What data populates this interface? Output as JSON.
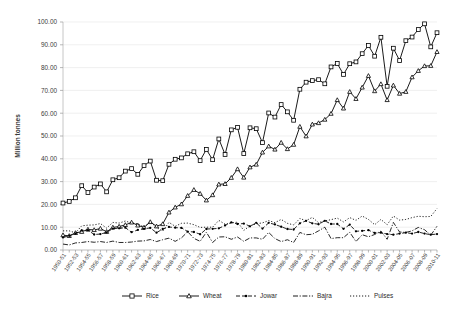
{
  "chart_data": {
    "type": "line",
    "title": "",
    "subtitle": "",
    "xlabel": "",
    "ylabel": "Million tonnes",
    "ylim": [
      0,
      100
    ],
    "ytick_labels": [
      "0.00",
      "10.00",
      "20.00",
      "30.00",
      "40.00",
      "50.00",
      "60.00",
      "70.00",
      "80.00",
      "90.00",
      "100.00"
    ],
    "ytick_values": [
      0,
      10,
      20,
      30,
      40,
      50,
      60,
      70,
      80,
      90,
      100
    ],
    "grid": true,
    "legend_position": "bottom",
    "x": [
      "1950-51",
      "1951-52",
      "1952-53",
      "1953-54",
      "1954-55",
      "1955-56",
      "1956-57",
      "1957-58",
      "1958-59",
      "1959-60",
      "1960-61",
      "1961-62",
      "1962-63",
      "1963-64",
      "1964-65",
      "1965-66",
      "1966-67",
      "1967-68",
      "1968-69",
      "1969-70",
      "1970-71",
      "1971-72",
      "1972-73",
      "1973-74",
      "1974-75",
      "1975-76",
      "1976-77",
      "1977-78",
      "1978-79",
      "1979-80",
      "1980-81",
      "1981-82",
      "1982-83",
      "1983-84",
      "1984-85",
      "1985-86",
      "1986-87",
      "1987-88",
      "1988-89",
      "1989-90",
      "1990-91",
      "1991-92",
      "1992-93",
      "1993-94",
      "1994-95",
      "1995-96",
      "1996-97",
      "1997-98",
      "1998-99",
      "1999-00",
      "2000-01",
      "2001-02",
      "2002-03",
      "2003-04",
      "2004-05",
      "2005-06",
      "2006-07",
      "2007-08",
      "2008-09",
      "2009-10",
      "2010-11"
    ],
    "xtick_labels": [
      "1950-51",
      "1952-53",
      "1954-55",
      "1956-57",
      "1958-59",
      "1960-61",
      "1962-63",
      "1964-65",
      "1966-67",
      "1968-69",
      "1970-71",
      "1972-73",
      "1974-75",
      "1976-77",
      "1978-79",
      "1980-81",
      "1982-83",
      "1984-85",
      "1986-87",
      "1988-89",
      "1990-91",
      "1992-93",
      "1994-95",
      "1996-97",
      "1998-99",
      "2000-01",
      "2002-03",
      "2004-05",
      "2006-07",
      "2008-09",
      "2010-11"
    ],
    "series": [
      {
        "name": "Rice",
        "marker": "square",
        "line_style": "solid",
        "color": "#000000",
        "values": [
          20.6,
          21.3,
          22.9,
          28.2,
          25.2,
          27.6,
          29.0,
          25.5,
          30.8,
          31.7,
          34.6,
          35.7,
          33.2,
          37.0,
          39.0,
          30.6,
          30.4,
          37.6,
          39.8,
          40.4,
          42.2,
          43.1,
          39.2,
          44.1,
          39.6,
          48.7,
          41.9,
          52.7,
          53.8,
          42.3,
          53.6,
          53.2,
          47.1,
          60.1,
          58.3,
          63.8,
          60.6,
          56.9,
          70.5,
          73.6,
          74.3,
          74.7,
          72.9,
          80.3,
          81.8,
          77.0,
          81.7,
          82.5,
          86.1,
          89.7,
          85.0,
          93.3,
          71.8,
          88.5,
          83.1,
          91.8,
          93.4,
          96.7,
          99.2,
          89.1,
          95.3
        ]
      },
      {
        "name": "Wheat",
        "marker": "triangle",
        "line_style": "solid",
        "color": "#000000",
        "values": [
          6.5,
          6.2,
          7.5,
          8.0,
          9.0,
          8.8,
          9.4,
          8.0,
          9.9,
          10.3,
          11.0,
          12.1,
          10.8,
          9.9,
          12.3,
          10.4,
          11.4,
          16.5,
          18.7,
          20.1,
          23.8,
          26.4,
          24.7,
          21.8,
          24.1,
          28.8,
          29.0,
          31.7,
          35.5,
          31.8,
          36.3,
          37.5,
          42.8,
          45.5,
          44.1,
          47.1,
          44.3,
          46.2,
          54.1,
          49.9,
          55.1,
          55.7,
          57.2,
          59.8,
          65.8,
          62.1,
          69.4,
          66.3,
          71.3,
          76.4,
          69.7,
          72.8,
          65.8,
          72.2,
          68.6,
          69.4,
          75.8,
          78.6,
          80.7,
          80.8,
          86.9
        ]
      },
      {
        "name": "Jowar",
        "marker": "small-square",
        "line_style": "dashed",
        "color": "#000000",
        "values": [
          5.5,
          6.2,
          7.2,
          8.6,
          8.7,
          6.8,
          7.0,
          7.7,
          9.4,
          9.5,
          9.8,
          7.8,
          8.8,
          9.3,
          9.7,
          7.6,
          9.2,
          10.1,
          9.8,
          9.7,
          8.1,
          7.9,
          6.9,
          9.2,
          9.3,
          9.5,
          10.8,
          12.1,
          11.4,
          11.6,
          10.4,
          11.9,
          9.4,
          11.9,
          11.2,
          10.2,
          9.2,
          9.0,
          11.7,
          12.8,
          11.7,
          11.3,
          12.8,
          11.4,
          11.4,
          9.3,
          11.1,
          8.2,
          8.4,
          8.7,
          7.5,
          7.6,
          7.0,
          6.7,
          7.2,
          7.6,
          7.2,
          7.9,
          7.2,
          6.7,
          7.0
        ]
      },
      {
        "name": "Bajra",
        "marker": "none",
        "line_style": "dash-dot",
        "color": "#000000",
        "values": [
          2.6,
          2.2,
          3.1,
          3.3,
          3.7,
          3.4,
          3.7,
          3.3,
          3.9,
          3.3,
          3.3,
          3.5,
          3.9,
          4.0,
          4.6,
          3.7,
          4.5,
          5.2,
          3.8,
          5.3,
          8.0,
          5.1,
          3.8,
          7.8,
          3.3,
          5.7,
          5.8,
          4.7,
          5.7,
          3.8,
          5.3,
          5.3,
          4.7,
          7.7,
          5.0,
          3.7,
          4.5,
          3.3,
          7.7,
          6.7,
          6.9,
          8.4,
          10.0,
          5.0,
          5.4,
          5.4,
          7.8,
          3.7,
          6.7,
          5.8,
          6.8,
          8.3,
          4.7,
          12.1,
          7.9,
          7.7,
          8.4,
          9.9,
          8.9,
          6.5,
          10.4
        ]
      },
      {
        "name": "Pulses",
        "marker": "none",
        "line_style": "dotted",
        "color": "#000000",
        "values": [
          8.4,
          8.4,
          7.5,
          10.6,
          10.9,
          11.0,
          11.6,
          9.6,
          12.1,
          11.8,
          12.7,
          11.8,
          11.5,
          10.1,
          12.4,
          9.9,
          8.3,
          12.1,
          10.4,
          11.7,
          11.8,
          11.1,
          9.9,
          10.0,
          10.0,
          13.0,
          11.3,
          11.9,
          12.2,
          8.6,
          10.6,
          11.5,
          11.9,
          12.9,
          12.0,
          13.4,
          11.7,
          11.0,
          13.8,
          12.9,
          14.3,
          12.0,
          12.8,
          13.3,
          14.0,
          12.3,
          14.2,
          13.0,
          14.9,
          13.4,
          11.1,
          13.4,
          11.1,
          14.9,
          13.1,
          13.4,
          14.2,
          14.8,
          14.6,
          14.7,
          18.2
        ]
      }
    ]
  },
  "legend": {
    "items": [
      {
        "label": "Rice"
      },
      {
        "label": "Wheat"
      },
      {
        "label": "Jowar"
      },
      {
        "label": "Bajra"
      },
      {
        "label": "Pulses"
      }
    ]
  }
}
